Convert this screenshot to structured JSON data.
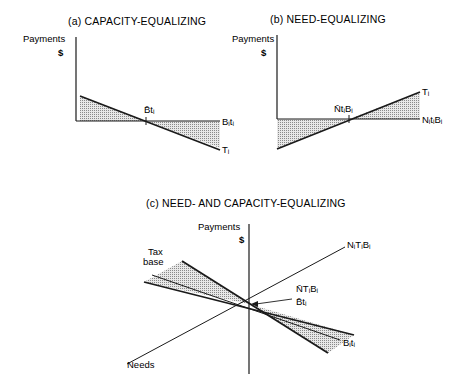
{
  "panels": [
    {
      "id": "a",
      "title": "(a) CAPACITY-EQUALIZING",
      "y_axis_label": "Payments",
      "y_axis_unit": "$",
      "labels": {
        "mean_point": "B̄tᵢ",
        "horizontal_line": "Bᵢtᵢ",
        "sloped_line": "Tᵢ"
      }
    },
    {
      "id": "b",
      "title": "(b) NEED-EQUALIZING",
      "y_axis_label": "Payments",
      "y_axis_unit": "$",
      "labels": {
        "mean_point": "N̄tᵢBᵢ",
        "horizontal_line": "NᵢtᵢBᵢ",
        "sloped_line": "Tᵢ"
      }
    },
    {
      "id": "c",
      "title": "(c) NEED- AND CAPACITY-EQUALIZING",
      "y_axis_label": "Payments",
      "y_axis_unit": "$",
      "labels": {
        "tax_base_axis": "Tax base",
        "tax_base_axis_line2": "base",
        "tax_base_axis_line1": "Tax",
        "needs_axis": "Needs",
        "need_line": "NᵢTᵢBᵢ",
        "mean_need_point": "N̄TᵢBᵢ",
        "mean_capacity_point": "B̄tᵢ",
        "capacity_line": "Bᵢtᵢ"
      }
    }
  ],
  "colors": {
    "ink": "#1a1a1a",
    "shade": "#c8c8c8",
    "background": "#ffffff"
  }
}
